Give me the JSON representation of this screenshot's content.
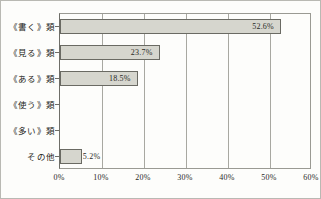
{
  "chart_data": {
    "type": "bar",
    "orientation": "horizontal",
    "title": "",
    "xlabel": "",
    "ylabel": "",
    "categories": [
      "《書く》類",
      "《見る》類",
      "《ある》類",
      "《使う》類",
      "《多い》類",
      "その他"
    ],
    "values": [
      52.6,
      23.7,
      18.5,
      0,
      0,
      5.2
    ],
    "value_labels": [
      "52.6%",
      "23.7%",
      "18.5%",
      "",
      "",
      "5.2%"
    ],
    "label_placement": [
      "inside",
      "inside",
      "inside",
      "none",
      "none",
      "outside"
    ],
    "xlim": [
      0,
      60
    ],
    "xticks": [
      0,
      10,
      20,
      30,
      40,
      50,
      60
    ],
    "xtick_labels": [
      "0%",
      "10%",
      "20%",
      "30%",
      "40%",
      "50%",
      "60%"
    ],
    "grid": "vertical",
    "legend": "none",
    "bar_fill_color": "#d6d6ce",
    "bar_border_color": "#6a6a63",
    "gridline_color": "#a8a8a1",
    "axis_color": "#6e6e68",
    "text_color": "#2a2a26",
    "background_color": "#fdfdfb"
  }
}
